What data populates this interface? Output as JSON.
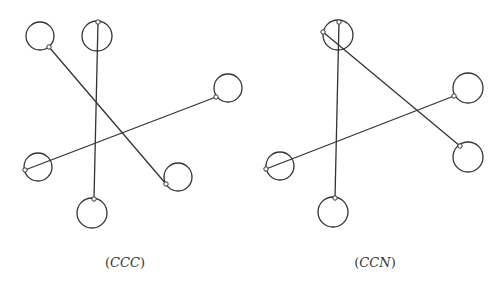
{
  "figure": {
    "stroke_color": "#333333",
    "background": "#ffffff",
    "panels": [
      {
        "id": "ccc",
        "caption_open": "(",
        "caption_text": "CCC",
        "caption_close": ")",
        "caption_pos": [
          125,
          255
        ],
        "circles": [
          {
            "cx": 40,
            "cy": 36,
            "r": 14
          },
          {
            "cx": 97,
            "cy": 36,
            "r": 15
          },
          {
            "cx": 228,
            "cy": 88,
            "r": 14
          },
          {
            "cx": 38,
            "cy": 167,
            "r": 14
          },
          {
            "cx": 178,
            "cy": 177,
            "r": 14
          },
          {
            "cx": 92,
            "cy": 213,
            "r": 15
          }
        ],
        "segments": [
          {
            "x1": 49,
            "y1": 47,
            "x2": 166,
            "y2": 184
          },
          {
            "x1": 98,
            "y1": 22,
            "x2": 94,
            "y2": 199
          },
          {
            "x1": 216,
            "y1": 97,
            "x2": 25,
            "y2": 170
          }
        ]
      },
      {
        "id": "ccn",
        "caption_open": "(",
        "caption_text": "CCN",
        "caption_close": ")",
        "caption_pos": [
          375,
          255
        ],
        "circles": [
          {
            "cx": 338,
            "cy": 35,
            "r": 15
          },
          {
            "cx": 468,
            "cy": 88,
            "r": 15
          },
          {
            "cx": 468,
            "cy": 157,
            "r": 15
          },
          {
            "cx": 280,
            "cy": 166,
            "r": 14
          },
          {
            "cx": 333,
            "cy": 212,
            "r": 15
          }
        ],
        "segments": [
          {
            "x1": 323,
            "y1": 32,
            "x2": 460,
            "y2": 146
          },
          {
            "x1": 339,
            "y1": 22,
            "x2": 335,
            "y2": 198
          },
          {
            "x1": 454,
            "y1": 96,
            "x2": 266,
            "y2": 169
          }
        ]
      }
    ]
  }
}
